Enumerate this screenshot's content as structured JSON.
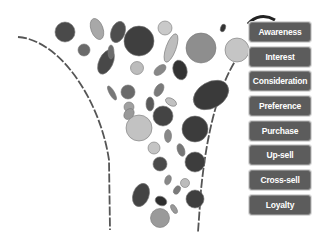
{
  "diagram": {
    "type": "marketing-funnel",
    "stages": [
      {
        "label": "Awareness"
      },
      {
        "label": "Interest"
      },
      {
        "label": "Consideration"
      },
      {
        "label": "Preference"
      },
      {
        "label": "Purchase"
      },
      {
        "label": "Up-sell"
      },
      {
        "label": "Cross-sell"
      },
      {
        "label": "Loyalty"
      }
    ],
    "colors": {
      "dark": "#4a4a4a",
      "mid": "#8c8c8c",
      "light": "#c4c4c4",
      "stage_fill": "#5c5c5c",
      "stage_text": "#ffffff",
      "funnel_line": "#555555"
    }
  }
}
